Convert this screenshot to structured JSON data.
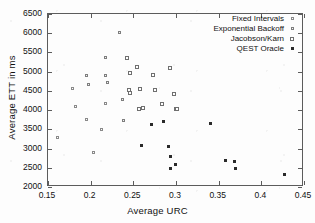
{
  "chart_data": {
    "type": "scatter",
    "title": "",
    "xlabel": "Average URC",
    "ylabel": "Average ETT in ms",
    "xlim": [
      0.15,
      0.45
    ],
    "ylim": [
      2000,
      6500
    ],
    "xticks": [
      "0.15",
      "0.2",
      "0.25",
      "0.3",
      "0.35",
      "0.4",
      "0.45"
    ],
    "xtick_values": [
      0.15,
      0.2,
      0.25,
      0.3,
      0.35,
      0.4,
      0.45
    ],
    "yticks": [
      "2000",
      "2500",
      "3000",
      "3500",
      "4000",
      "4500",
      "5000",
      "5500",
      "6000",
      "6500"
    ],
    "ytick_values": [
      2000,
      2500,
      3000,
      3500,
      4000,
      4500,
      5000,
      5500,
      6000,
      6500
    ],
    "grid": false,
    "legend_position": "top-right",
    "series": [
      {
        "name": "Fixed Intervals",
        "marker": "open-square-small",
        "color": "#8a8a8a",
        "points": [
          [
            0.162,
            3270
          ],
          [
            0.18,
            4530
          ],
          [
            0.183,
            4065
          ],
          [
            0.196,
            3725
          ],
          [
            0.204,
            2870
          ],
          [
            0.214,
            3475
          ],
          [
            0.219,
            4150
          ]
        ]
      },
      {
        "name": "Exponential Backoff",
        "marker": "open-square-small",
        "color": "#7e7e7e",
        "points": [
          [
            0.196,
            4875
          ],
          [
            0.199,
            4630
          ],
          [
            0.218,
            4885
          ],
          [
            0.221,
            4680
          ],
          [
            0.218,
            5335
          ],
          [
            0.235,
            6005
          ],
          [
            0.239,
            4240
          ],
          [
            0.24,
            3715
          ]
        ]
      },
      {
        "name": "Jacobson/Karn",
        "marker": "open-square",
        "color": "#6f6f6f",
        "points": [
          [
            0.244,
            5340
          ],
          [
            0.247,
            4945
          ],
          [
            0.246,
            4485
          ],
          [
            0.247,
            4420
          ],
          [
            0.256,
            5095
          ],
          [
            0.259,
            4530
          ],
          [
            0.258,
            4010
          ],
          [
            0.262,
            4040
          ],
          [
            0.274,
            4890
          ],
          [
            0.276,
            4495
          ],
          [
            0.285,
            4120
          ],
          [
            0.294,
            5060
          ],
          [
            0.299,
            4390
          ],
          [
            0.301,
            4015
          ],
          [
            0.302,
            4010
          ]
        ]
      },
      {
        "name": "QEST Oracle",
        "marker": "filled-square",
        "color": "#2a2a2a",
        "points": [
          [
            0.261,
            3055
          ],
          [
            0.272,
            3605
          ],
          [
            0.286,
            3675
          ],
          [
            0.292,
            3030
          ],
          [
            0.295,
            2755
          ],
          [
            0.295,
            2460
          ],
          [
            0.301,
            2570
          ],
          [
            0.342,
            3625
          ],
          [
            0.359,
            2660
          ],
          [
            0.37,
            2645
          ],
          [
            0.371,
            2455
          ],
          [
            0.428,
            2300
          ]
        ]
      }
    ]
  }
}
